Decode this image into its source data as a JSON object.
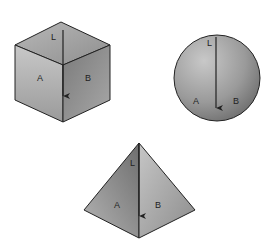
{
  "figure": {
    "shapes": [
      {
        "name": "cube",
        "labels": {
          "line": "L",
          "face_a": "A",
          "face_b": "B"
        }
      },
      {
        "name": "sphere",
        "labels": {
          "line": "L",
          "face_a": "A",
          "face_b": "B"
        }
      },
      {
        "name": "pyramid",
        "labels": {
          "line": "L",
          "face_a": "A",
          "face_b": "B"
        }
      }
    ],
    "colors": {
      "background": "#ffffff",
      "outline": "#222222",
      "face_light": "#c4c4c4",
      "face_mid": "#9a9a9a",
      "face_dark": "#6e6e6e"
    }
  }
}
